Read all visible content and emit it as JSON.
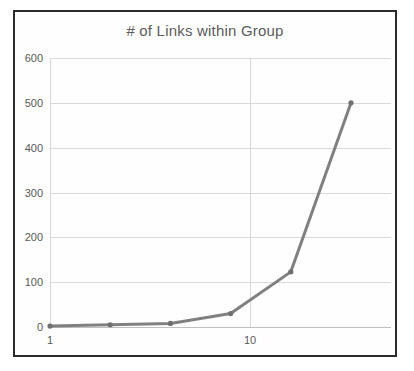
{
  "chart_data": {
    "type": "line",
    "title": "# of Links within Group",
    "xlabel": "",
    "ylabel": "",
    "xscale": "log",
    "yscale": "linear",
    "xlim": [
      1,
      32
    ],
    "ylim": [
      0,
      600
    ],
    "grid": true,
    "legend": false,
    "legend_position": "none",
    "x_tick_labels": [
      "1",
      "10"
    ],
    "x_ticks": [
      1,
      10
    ],
    "y_ticks": [
      0,
      100,
      200,
      300,
      400,
      500,
      600
    ],
    "y_tick_labels": [
      "0",
      "100",
      "200",
      "300",
      "400",
      "500",
      "600"
    ],
    "series": [
      {
        "name": "# of Links within Group",
        "color": "#808080",
        "marker": "circle",
        "x": [
          1,
          2,
          4,
          8,
          16,
          32
        ],
        "values": [
          2,
          5,
          8,
          30,
          123,
          500
        ]
      }
    ],
    "points": [
      {
        "x": 1,
        "y": 2
      },
      {
        "x": 2,
        "y": 5
      },
      {
        "x": 4,
        "y": 8
      },
      {
        "x": 8,
        "y": 30
      },
      {
        "x": 16,
        "y": 123
      },
      {
        "x": 32,
        "y": 500
      }
    ]
  },
  "style": {
    "line_color": "#808080",
    "marker_color": "#6f6f6f",
    "grid_color": "#d9d9d9",
    "axis_color": "#bfbfbf",
    "border_color": "#2b2b2b",
    "title_color": "#5b5b5b",
    "tick_color": "#595959",
    "plot_background": "#fefefe"
  }
}
